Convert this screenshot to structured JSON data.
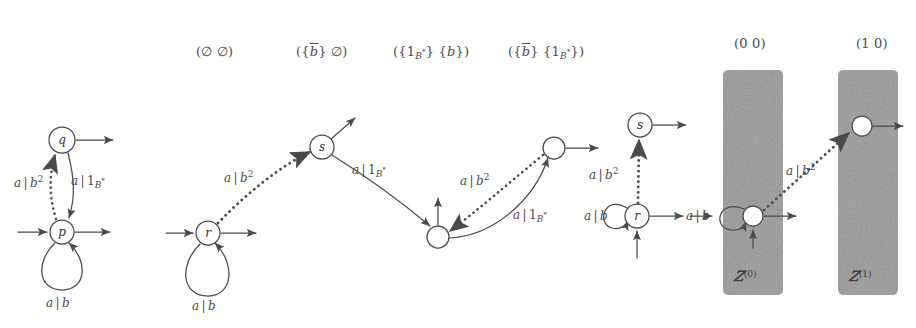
{
  "figure": {
    "background_color": "#ffffff",
    "ink_color": "#4a4a4a",
    "panel_fill": "#a8a8a8"
  },
  "column_headers": [
    {
      "id": "h1",
      "text": "(∅ ∅)",
      "x": 196,
      "y": 44
    },
    {
      "id": "h2",
      "text": "({b̄} ∅)",
      "x": 296,
      "y": 44
    },
    {
      "id": "h3",
      "text": "({1B*} {b})",
      "x": 393,
      "y": 44
    },
    {
      "id": "h4",
      "text": "({b̄} {1B*})",
      "x": 508,
      "y": 44
    },
    {
      "id": "h5",
      "text": "(0 0)",
      "x": 734,
      "y": 36
    },
    {
      "id": "h6",
      "text": "(1 0)",
      "x": 856,
      "y": 36
    }
  ],
  "automata": [
    {
      "id": "automaton-1",
      "states": [
        {
          "name": "q",
          "x": 62,
          "y": 140,
          "r": 13
        },
        {
          "name": "p",
          "x": 62,
          "y": 232,
          "r": 12
        }
      ],
      "edges": [
        {
          "from": "p",
          "to": "q",
          "label": "a|b²",
          "style": "dotted"
        },
        {
          "from": "q",
          "to": "p",
          "label": "a|1B*",
          "style": "solid"
        },
        {
          "from": "p",
          "to": "p",
          "label": "a|b",
          "style": "self-loop"
        }
      ],
      "edge_labels": [
        {
          "text": "a|b²",
          "x": 16,
          "y": 180
        },
        {
          "text": "a|1B*",
          "x": 72,
          "y": 180
        },
        {
          "text": "a|b",
          "x": 47,
          "y": 296
        }
      ]
    },
    {
      "id": "automaton-2",
      "states": [
        {
          "name": "r",
          "x": 208,
          "y": 233,
          "r": 12
        },
        {
          "name": "s",
          "x": 322,
          "y": 147,
          "r": 12
        }
      ],
      "edges": [
        {
          "from": "r",
          "to": "s",
          "label": "a|b²",
          "style": "dotted"
        },
        {
          "from": "r",
          "to": "r",
          "label": "a|b",
          "style": "self-loop"
        }
      ],
      "edge_labels": [
        {
          "text": "a|b²",
          "x": 226,
          "y": 175
        },
        {
          "text": "a|b",
          "x": 193,
          "y": 299
        }
      ]
    },
    {
      "id": "automaton-3",
      "states": [
        {
          "name": "",
          "x": 438,
          "y": 237,
          "r": 11
        },
        {
          "name": "",
          "x": 554,
          "y": 148,
          "r": 11
        }
      ],
      "edges": [
        {
          "from": "node-a",
          "to": "node-b",
          "label": "a|1B*",
          "style": "solid"
        },
        {
          "from": "node-b",
          "to": "node-a",
          "label": "a|b²",
          "style": "dotted"
        },
        {
          "from": "node-b",
          "to": "node-a",
          "label": "a|1B*",
          "style": "solid"
        }
      ],
      "edge_labels": [
        {
          "text": "a|1B*",
          "x": 352,
          "y": 175
        },
        {
          "text": "a|b²",
          "x": 462,
          "y": 178
        },
        {
          "text": "a|1B*",
          "x": 518,
          "y": 213
        }
      ]
    },
    {
      "id": "automaton-4",
      "states": [
        {
          "name": "s",
          "x": 640,
          "y": 125,
          "r": 12
        },
        {
          "name": "r",
          "x": 637,
          "y": 216,
          "r": 12
        }
      ],
      "edges": [
        {
          "from": "r",
          "to": "s",
          "label": "a|b²",
          "style": "dotted"
        },
        {
          "from": "r",
          "to": "r",
          "label": "a|b",
          "style": "self-loop"
        }
      ],
      "edge_labels": [
        {
          "text": "a|b²",
          "x": 592,
          "y": 172
        },
        {
          "text": "a|b",
          "x": 585,
          "y": 210
        }
      ]
    }
  ],
  "panels": [
    {
      "id": "panel-z0",
      "caption": "Z(0)",
      "x": 723,
      "y": 70,
      "width": 60,
      "height": 225,
      "node": {
        "x": 753,
        "y": 216,
        "r": 10
      },
      "edge_labels": [
        {
          "text": "a|b",
          "x": 688,
          "y": 210
        }
      ]
    },
    {
      "id": "panel-z1",
      "caption": "Z(1)",
      "x": 838,
      "y": 70,
      "width": 60,
      "height": 225,
      "node": {
        "x": 862,
        "y": 126,
        "r": 10
      },
      "edge_labels": [
        {
          "text": "a|b²",
          "x": 788,
          "y": 168
        }
      ]
    }
  ],
  "cross_panel_edge": {
    "from": "panel-z0-node",
    "to": "panel-z1-node",
    "label": "a|b²",
    "style": "dotted"
  }
}
